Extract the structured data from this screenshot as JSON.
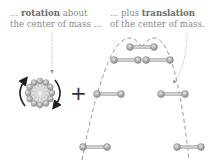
{
  "captions": {
    "left": {
      "line1_prefix": "... ",
      "line1_bold": "rotation",
      "line1_suffix": " about",
      "line2": "the center of mass ..."
    },
    "right": {
      "line1_prefix": "... plus ",
      "line1_bold": "translation",
      "line2": "of the center of mass."
    }
  },
  "symbols": {
    "plus": "+"
  },
  "colors": {
    "text": "#8a8a8a",
    "bold_text": "#6a6a6a",
    "dumbbell": "#9a9a9a",
    "arrow": "#222222",
    "dashed": "#8a8a8a"
  }
}
